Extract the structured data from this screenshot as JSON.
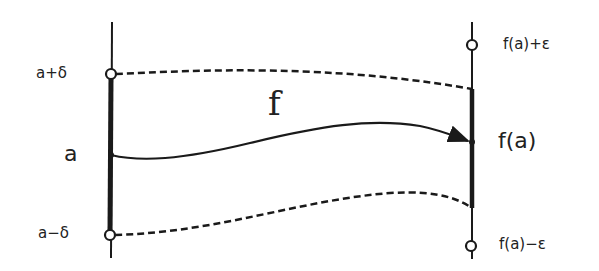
{
  "diagram": {
    "type": "continuity-epsilon-delta",
    "function_label": "f",
    "left_axis": {
      "labels": {
        "upper": "a+δ",
        "center": "a",
        "lower": "a−δ"
      }
    },
    "right_axis": {
      "labels": {
        "upper": "f(a)+ε",
        "center": "f(a)",
        "lower": "f(a)−ε"
      }
    },
    "colors": {
      "stroke": "#1a1a1a",
      "background": "#ffffff"
    }
  }
}
